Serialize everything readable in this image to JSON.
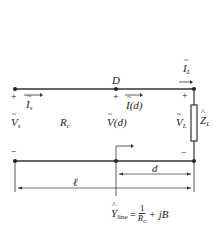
{
  "diagram": {
    "type": "transmission-line-circuit",
    "nodes": {
      "D": "D"
    },
    "source": {
      "voltage": "V",
      "voltage_sub": "s",
      "current": "I",
      "current_sub": "s",
      "plus": "+",
      "minus": "−"
    },
    "line": {
      "resistance": "R",
      "resistance_sub": "c",
      "voltage_at_d": "V(d)",
      "current_at_d": "I(d)",
      "plus": "+"
    },
    "load": {
      "voltage": "V",
      "voltage_sub": "L",
      "current": "I",
      "current_sub": "L",
      "impedance": "Z",
      "impedance_sub": "L",
      "plus": "+",
      "minus": "−"
    },
    "dimensions": {
      "length": "ℓ",
      "distance": "d"
    },
    "formula": {
      "lhs": "Y",
      "lhs_sub": "line",
      "equals": "=",
      "numerator": "1",
      "denominator": "R",
      "denominator_sub": "c",
      "rest": "+ jB"
    },
    "colors": {
      "line": "#333333",
      "background": "#ffffff"
    }
  }
}
